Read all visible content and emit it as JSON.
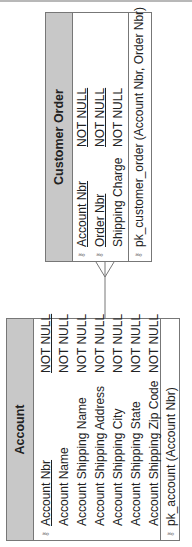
{
  "diagram": {
    "type": "entity-relationship",
    "orientation": "rotated-90-ccw",
    "entities": [
      {
        "name": "Account",
        "attributes": [
          {
            "name": "Account Nbr",
            "constraint": "NOT NULL",
            "primary_key": true
          },
          {
            "name": "Account Name",
            "constraint": "NOT NULL",
            "primary_key": false
          },
          {
            "name": "Account Shipping Name",
            "constraint": "NOT NULL",
            "primary_key": false
          },
          {
            "name": "Account Shipping Address",
            "constraint": "NOT NULL",
            "primary_key": false
          },
          {
            "name": "Account Shipping City",
            "constraint": "NOT NULL",
            "primary_key": false
          },
          {
            "name": "Account Shipping State",
            "constraint": "NOT NULL",
            "primary_key": false
          },
          {
            "name": "Account Shipping Zip Code",
            "constraint": "NOT NULL",
            "primary_key": false
          }
        ],
        "key_constraint": "pk_account (Account Nbr)"
      },
      {
        "name": "Customer Order",
        "attributes": [
          {
            "name": "Account Nbr",
            "constraint": "NOT NULL",
            "primary_key": true
          },
          {
            "name": "Order Nbr",
            "constraint": "NOT NULL",
            "primary_key": true
          },
          {
            "name": "Shipping Charge",
            "constraint": "NOT NULL",
            "primary_key": false
          }
        ],
        "key_constraint": "pk_customer_order (Account Nbr, Order Nbr)"
      }
    ],
    "relationships": [
      {
        "from": "Account",
        "to": "Customer Order",
        "cardinality": "one-to-many",
        "many_end": "Customer Order"
      }
    ]
  },
  "icons": {
    "key": "key-icon"
  },
  "colors": {
    "header_bg": "#c8c8c8",
    "border": "#777777",
    "line": "#777777"
  }
}
